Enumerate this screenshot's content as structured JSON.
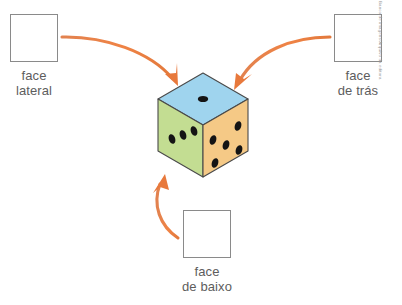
{
  "page": {
    "width": 402,
    "height": 305,
    "background": "#ffffff",
    "credit": "Banco de imagens/Arquivo da editora"
  },
  "callouts": [
    {
      "id": "lateral",
      "box_label": "",
      "caption_line1": "face",
      "caption_line2": "lateral",
      "arrow_name": "arrow-lateral-to-cube"
    },
    {
      "id": "tras",
      "box_label": "",
      "caption_line1": "face",
      "caption_line2": "de trás",
      "arrow_name": "arrow-tras-to-cube"
    },
    {
      "id": "baixo",
      "box_label": "",
      "caption_line1": "face",
      "caption_line2": "de baixo",
      "arrow_name": "arrow-baixo-to-cube"
    }
  ],
  "cube": {
    "name": "dice-cube",
    "faces": {
      "top": {
        "color": "#9fd4ee",
        "pips": 1,
        "label": "face de cima"
      },
      "left": {
        "color": "#c3dd92",
        "pips": 3,
        "label": "face da frente"
      },
      "right": {
        "color": "#f5c986",
        "pips": 5,
        "label": "face lateral direita"
      }
    },
    "pip_color": "#1a1a1a",
    "edge_color": "#4a4a4a"
  },
  "colors": {
    "arrow": "#e8793c",
    "box_border": "#8a8a8a",
    "caption_text": "#5d5d5d"
  }
}
